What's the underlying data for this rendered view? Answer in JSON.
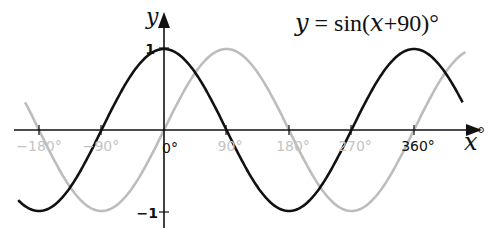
{
  "chart_data": {
    "type": "line",
    "title": "y = sin(x+90)°",
    "xlabel": "x°",
    "ylabel": "y",
    "xlim": [
      -200,
      420
    ],
    "ylim": [
      -1.2,
      1.2
    ],
    "grid": false,
    "x_ticks": [
      -180,
      -90,
      0,
      90,
      180,
      270,
      360
    ],
    "x_tick_labels": [
      "-180°",
      "-90°",
      "0°",
      "90°",
      "180°",
      "270°",
      "360°"
    ],
    "y_ticks": [
      1,
      -1
    ],
    "y_tick_labels": [
      "1",
      "−1"
    ],
    "series": [
      {
        "name": "y = sin(x+90)°",
        "color": "#111111",
        "x_range": [
          -210,
          430
        ],
        "function": "sin(x+90)",
        "sample_points": [
          {
            "x": -180,
            "y": -1
          },
          {
            "x": -90,
            "y": 0
          },
          {
            "x": 0,
            "y": 1
          },
          {
            "x": 90,
            "y": 0
          },
          {
            "x": 180,
            "y": -1
          },
          {
            "x": 270,
            "y": 0
          },
          {
            "x": 360,
            "y": 1
          }
        ]
      },
      {
        "name": "y = sin x°",
        "color": "#bdbdbd",
        "x_range": [
          -200,
          435
        ],
        "function": "sin(x)",
        "sample_points": [
          {
            "x": -180,
            "y": 0
          },
          {
            "x": -90,
            "y": -1
          },
          {
            "x": 0,
            "y": 0
          },
          {
            "x": 90,
            "y": 1
          },
          {
            "x": 180,
            "y": 0
          },
          {
            "x": 270,
            "y": -1
          },
          {
            "x": 360,
            "y": 0
          }
        ]
      }
    ],
    "annotations": [
      {
        "text": "y = sin(x+90)°",
        "position": "top-right"
      }
    ]
  },
  "labels": {
    "equation_y": "y",
    "equation_rest": " = sin(",
    "equation_x": "x",
    "equation_tail": "+90)°",
    "axis_y": "y",
    "axis_x": "x",
    "axis_x_degree": "°",
    "y_one": "1",
    "y_minus_one": "−1",
    "x_ticks": {
      "m180": "−180°",
      "m90": "−90°",
      "zero": "0°",
      "p90": "90°",
      "p180": "180°",
      "p270": "270°",
      "p360": "360°"
    }
  },
  "colors": {
    "primary_curve": "#111111",
    "secondary_curve": "#bdbdbd",
    "axis": "#111111",
    "grey_label": "#c4c4c4"
  }
}
